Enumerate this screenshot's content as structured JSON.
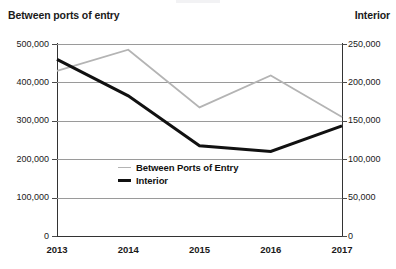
{
  "chart_data": {
    "type": "line",
    "title": "",
    "xlabel": "",
    "categories": [
      "2013",
      "2014",
      "2015",
      "2016",
      "2017"
    ],
    "grid": true,
    "legend_position": "inside-center",
    "axes": {
      "left": {
        "label": "Between ports of entry",
        "ticks": [
          "0",
          "100,000",
          "200,000",
          "300,000",
          "400,000",
          "500,000"
        ],
        "tick_values": [
          0,
          100000,
          200000,
          300000,
          400000,
          500000
        ],
        "min": 0,
        "max": 500000
      },
      "right": {
        "label": "Interior",
        "ticks": [
          "0",
          "50,000",
          "100,000",
          "150,000",
          "200,000",
          "250,000"
        ],
        "tick_values": [
          0,
          50000,
          100000,
          150000,
          200000,
          250000
        ],
        "min": 0,
        "max": 250000
      }
    },
    "series": [
      {
        "name": "Between Ports of Entry",
        "axis": "left",
        "color": "#b4b4b4",
        "width": 1.8,
        "values": [
          430000,
          485000,
          335000,
          418000,
          310000
        ]
      },
      {
        "name": "Interior",
        "axis": "right",
        "color": "#111111",
        "width": 3.0,
        "values": [
          230000,
          182500,
          117500,
          110000,
          143500
        ]
      }
    ]
  },
  "legend": {
    "items": [
      {
        "label": "Between Ports of Entry",
        "style": "thin"
      },
      {
        "label": "Interior",
        "style": "thick"
      }
    ]
  }
}
